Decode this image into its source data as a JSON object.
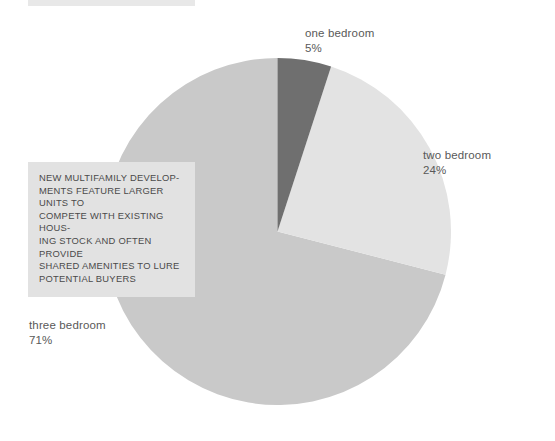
{
  "top_bar": {
    "name": "decorative-rule",
    "color": "#e8e8e8"
  },
  "callout": {
    "text": "New multifamily develop-\nments feature larger units to\ncompete with existing hous-\ning stock and often provide\nshared amenities to lure\npotential buyers",
    "background": "#e2e2e2",
    "text_color": "#4a4a4a"
  },
  "labels": {
    "one": {
      "name": "one bedroom",
      "pct": "5%"
    },
    "two": {
      "name": "two bedroom",
      "pct": "24%"
    },
    "three": {
      "name": "three bedroom",
      "pct": "71%"
    }
  },
  "chart_data": {
    "type": "pie",
    "title": "",
    "categories": [
      "one bedroom",
      "two bedroom",
      "three bedroom"
    ],
    "values": [
      5,
      24,
      71
    ],
    "value_labels": [
      "5%",
      "24%",
      "71%"
    ],
    "unit": "%",
    "total": 100,
    "start_angle_deg": 0,
    "direction": "clockwise",
    "colors": [
      "#6f6f6f",
      "#e3e3e3",
      "#c9c9c9"
    ],
    "legend": "none",
    "grid": false,
    "annotations": [
      "New multifamily developments feature larger units to compete with existing housing stock and often provide shared amenities to lure potential buyers"
    ]
  }
}
